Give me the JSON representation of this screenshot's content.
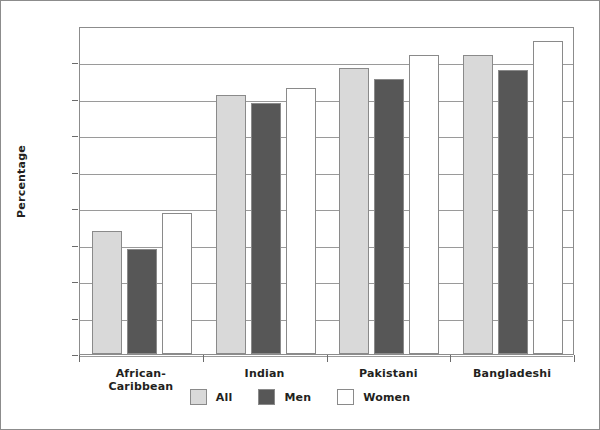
{
  "chart_data": {
    "type": "bar",
    "title": "",
    "xlabel": "",
    "ylabel": "Percentage",
    "ylim": [
      0,
      90
    ],
    "yticks": [
      0,
      10,
      20,
      30,
      40,
      50,
      60,
      70,
      80,
      90
    ],
    "ytick_labels": [
      "0",
      "10",
      "20",
      "30",
      "40",
      "50",
      "60",
      "70",
      "80",
      "90"
    ],
    "grid": true,
    "legend_position": "bottom",
    "categories": [
      "African-Caribbean",
      "Indian",
      "Pakistani",
      "Bangladeshi"
    ],
    "category_lines": [
      [
        "African-",
        "Caribbean"
      ],
      [
        "Indian"
      ],
      [
        "Pakistani"
      ],
      [
        "Bangladeshi"
      ]
    ],
    "series": [
      {
        "name": "All",
        "color": "#d9d9d9",
        "values": [
          33.8,
          71.2,
          78.5,
          82.0
        ]
      },
      {
        "name": "Men",
        "color": "#575757",
        "values": [
          28.8,
          69.0,
          75.5,
          78.0
        ]
      },
      {
        "name": "Women",
        "color": "#ffffff",
        "values": [
          38.7,
          73.0,
          82.0,
          86.0
        ]
      }
    ]
  },
  "legend": {
    "items": [
      {
        "label": "All",
        "color": "#d9d9d9"
      },
      {
        "label": "Men",
        "color": "#575757"
      },
      {
        "label": "Women",
        "color": "#ffffff"
      }
    ]
  }
}
